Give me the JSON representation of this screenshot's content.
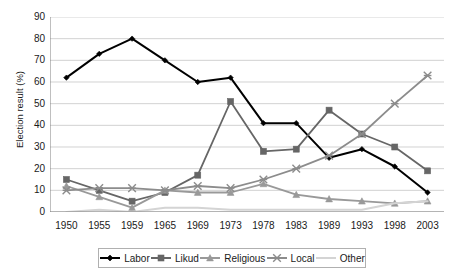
{
  "chart_data": {
    "type": "line",
    "title": "",
    "xlabel": "",
    "ylabel": "Election result (%)",
    "ylim": [
      0,
      90
    ],
    "ytick_step": 10,
    "yticks": [
      0,
      10,
      20,
      30,
      40,
      50,
      60,
      70,
      80,
      90
    ],
    "grid": true,
    "legend_position": "bottom",
    "categories": [
      "1950",
      "1955",
      "1959",
      "1965",
      "1969",
      "1973",
      "1978",
      "1983",
      "1989",
      "1993",
      "1998",
      "2003"
    ],
    "series": [
      {
        "name": "Labor",
        "color": "#000000",
        "marker": "diamond",
        "values": [
          62,
          73,
          80,
          70,
          60,
          62,
          41,
          41,
          25,
          29,
          21,
          9
        ]
      },
      {
        "name": "Likud",
        "color": "#666666",
        "marker": "square",
        "values": [
          15,
          10,
          5,
          9,
          17,
          51,
          28,
          29,
          47,
          36,
          30,
          19
        ]
      },
      {
        "name": "Religious",
        "color": "#999999",
        "marker": "triangle",
        "values": [
          12,
          7,
          2,
          10,
          9,
          9,
          13,
          8,
          6,
          5,
          4,
          5
        ]
      },
      {
        "name": "Local",
        "color": "#8c8c8c",
        "marker": "cross",
        "values": [
          10,
          11,
          11,
          10,
          12,
          11,
          15,
          20,
          26,
          36,
          50,
          63
        ]
      },
      {
        "name": "Other",
        "color": "#d4d4d4",
        "marker": "none",
        "values": [
          0,
          1,
          0,
          2,
          2,
          1,
          1,
          1,
          1,
          1,
          4,
          5
        ]
      }
    ]
  },
  "axis": {
    "y_label": "Election result (%)",
    "y_ticks": [
      "90",
      "80",
      "70",
      "60",
      "50",
      "40",
      "30",
      "20",
      "10",
      "0"
    ],
    "x_ticks": [
      "1950",
      "1955",
      "1959",
      "1965",
      "1969",
      "1973",
      "1978",
      "1983",
      "1989",
      "1993",
      "1998",
      "2003"
    ]
  },
  "legend": {
    "items": [
      {
        "label": "Labor"
      },
      {
        "label": "Likud"
      },
      {
        "label": "Religious"
      },
      {
        "label": "Local"
      },
      {
        "label": "Other"
      }
    ]
  },
  "colors": {
    "background": "#ffffff",
    "gridline": "#bfbfbf",
    "axis": "#808080",
    "text": "#1a1a1a",
    "legend_border": "#b0b0b0"
  }
}
